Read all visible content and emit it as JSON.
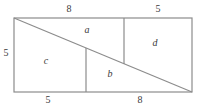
{
  "figure": {
    "type": "geometry-diagram",
    "stroke_color": "#8c8c8c",
    "text_color": "#3a3a3a",
    "background_color": "#ffffff",
    "outline": {
      "shape": "rectangle",
      "left": 14,
      "top": 18,
      "right": 192,
      "bottom": 92
    },
    "diagonal": {
      "from": [
        14,
        18
      ],
      "to": [
        192,
        92
      ]
    },
    "internal_lines": [
      {
        "name": "left-vertical-divider",
        "from": [
          86,
          48
        ],
        "to": [
          86,
          92
        ]
      },
      {
        "name": "right-vertical-divider",
        "from": [
          124,
          18
        ],
        "to": [
          124,
          64
        ]
      }
    ],
    "dimension_labels": [
      {
        "id": "top-left-dim",
        "text": "8",
        "x": 69,
        "y": 9,
        "side": "top"
      },
      {
        "id": "top-right-dim",
        "text": "5",
        "x": 158,
        "y": 9,
        "side": "top"
      },
      {
        "id": "left-dim",
        "text": "5",
        "x": 6,
        "y": 53,
        "side": "left"
      },
      {
        "id": "bottom-left-dim",
        "text": "5",
        "x": 48,
        "y": 100,
        "side": "bottom"
      },
      {
        "id": "bottom-right-dim",
        "text": "8",
        "x": 140,
        "y": 100,
        "side": "bottom"
      }
    ],
    "region_labels": [
      {
        "id": "region-a",
        "text": "a",
        "x": 87,
        "y": 30
      },
      {
        "id": "region-c",
        "text": "c",
        "x": 46,
        "y": 61
      },
      {
        "id": "region-b",
        "text": "b",
        "x": 110,
        "y": 74
      },
      {
        "id": "region-d",
        "text": "d",
        "x": 155,
        "y": 43
      }
    ]
  }
}
